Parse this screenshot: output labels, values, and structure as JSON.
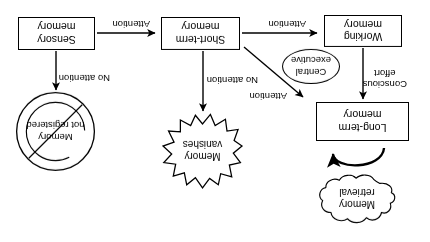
{
  "diagram": {
    "orientation_note": "rotated-180",
    "stroke_color": "#000000",
    "background_color": "#ffffff",
    "nodes": {
      "sensory_memory": "Sensory\nmemory",
      "short_term_memory": "Short-term\nmemory",
      "working_memory": "Working\nmemory",
      "long_term_memory": "Long-term\nmemory",
      "central_executive": "Central\nexecutive",
      "memory_vanishes": "Memory\nvanishes",
      "memory_not_registered": "Memory\nnot registered",
      "memory_retrieval": "Memory\nretrieval"
    },
    "edge_labels": {
      "sensory_to_short_term": "Attention",
      "sensory_to_not_registered": "No attention",
      "short_term_to_working": "Attention",
      "short_term_to_vanishes": "No attention",
      "central_executive_to_long_term": "Attention",
      "working_to_long_term": "Conscious\neffort"
    }
  }
}
